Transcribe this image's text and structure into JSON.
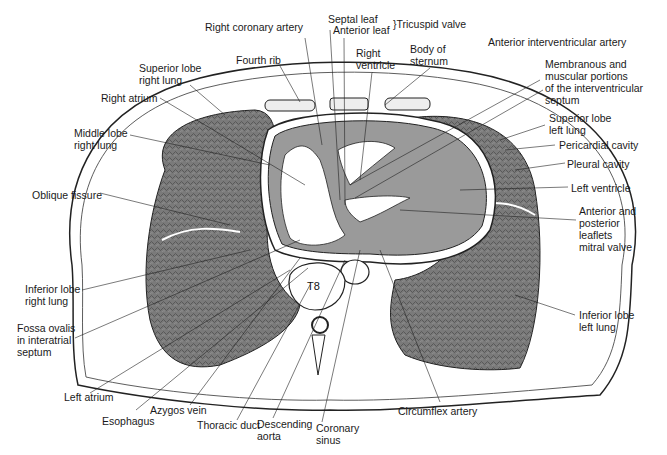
{
  "figure": {
    "vertebra_label": "T8",
    "colors": {
      "lung": "#6e6e6e",
      "heart_wall": "#9a9a9a",
      "line": "#222222",
      "background": "#ffffff"
    }
  },
  "labels": [
    {
      "id": "right-coronary-artery",
      "text": "Right coronary artery",
      "x": 205,
      "y": 27
    },
    {
      "id": "septal-leaf",
      "text": "Septal leaf",
      "x": 328,
      "y": 19
    },
    {
      "id": "anterior-leaf",
      "text": "Anterior leaf",
      "x": 333,
      "y": 30
    },
    {
      "id": "tricuspid-valve",
      "text": "}Tricuspid valve",
      "x": 395,
      "y": 23
    },
    {
      "id": "fourth-rib",
      "text": "Fourth rib",
      "x": 236,
      "y": 55
    },
    {
      "id": "right-ventricle",
      "text": "Right\nventricle",
      "x": 356,
      "y": 48
    },
    {
      "id": "body-of-sternum",
      "text": "Body of\nsternum",
      "x": 410,
      "y": 43
    },
    {
      "id": "anterior-interventricular-artery",
      "text": "Anterior interventricular artery",
      "x": 488,
      "y": 37
    },
    {
      "id": "superior-lobe-right-lung",
      "text": "Superior lobe\nright lung",
      "x": 139,
      "y": 63
    },
    {
      "id": "membranous-muscular-septum",
      "text": "Membranous and\nmuscular portions\nof the interventricular\nseptum",
      "x": 545,
      "y": 58
    },
    {
      "id": "right-atrium",
      "text": "Right atrium",
      "x": 101,
      "y": 92
    },
    {
      "id": "middle-lobe-right-lung",
      "text": "Middle lobe\nright lung",
      "x": 74,
      "y": 127
    },
    {
      "id": "superior-lobe-left-lung",
      "text": "Superior lobe\nleft lung",
      "x": 549,
      "y": 112
    },
    {
      "id": "pericardial-cavity",
      "text": "Pericardial cavity",
      "x": 559,
      "y": 139
    },
    {
      "id": "pleural-cavity",
      "text": "Pleural cavity",
      "x": 567,
      "y": 158
    },
    {
      "id": "oblique-fissure",
      "text": "Oblique fissure",
      "x": 32,
      "y": 189
    },
    {
      "id": "left-ventricle",
      "text": "Left ventricle",
      "x": 571,
      "y": 182
    },
    {
      "id": "mitral-valve-leaflets",
      "text": "Anterior and\nposterior\nleaflets\nmitral valve",
      "x": 579,
      "y": 205
    },
    {
      "id": "inferior-lobe-right-lung",
      "text": "Inferior lobe\nright lung",
      "x": 25,
      "y": 283
    },
    {
      "id": "inferior-lobe-left-lung",
      "text": "Inferior lobe\nleft lung",
      "x": 579,
      "y": 309
    },
    {
      "id": "fossa-ovalis",
      "text": "Fossa ovalis\nin interatrial\nseptum",
      "x": 17,
      "y": 322
    },
    {
      "id": "left-atrium",
      "text": "Left atrium",
      "x": 64,
      "y": 391
    },
    {
      "id": "esophagus",
      "text": "Esophagus",
      "x": 102,
      "y": 415
    },
    {
      "id": "azygos-vein",
      "text": "Azygos vein",
      "x": 150,
      "y": 408
    },
    {
      "id": "thoracic-duct",
      "text": "Thoracic duct",
      "x": 197,
      "y": 419
    },
    {
      "id": "descending-aorta",
      "text": "Descending\naorta",
      "x": 257,
      "y": 418
    },
    {
      "id": "coronary-sinus",
      "text": "Coronary\nsinus",
      "x": 316,
      "y": 422
    },
    {
      "id": "circumflex-artery",
      "text": "Circumflex artery",
      "x": 398,
      "y": 405
    }
  ]
}
